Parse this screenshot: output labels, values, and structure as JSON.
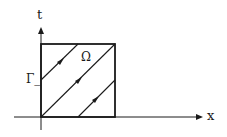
{
  "diagram": {
    "axes": {
      "vertical_label": "t",
      "horizontal_label": "x"
    },
    "region_label": "Ω",
    "boundary_label": "Γ_",
    "characteristics": [
      {
        "from": [
          41,
          80
        ],
        "to": [
          78,
          44
        ],
        "arrow_at": [
          62,
          60
        ]
      },
      {
        "from": [
          41,
          117
        ],
        "to": [
          115,
          44
        ],
        "arrow_at": [
          80,
          79
        ]
      },
      {
        "from": [
          78,
          117
        ],
        "to": [
          115,
          80
        ],
        "arrow_at": [
          97,
          98
        ]
      }
    ],
    "colors": {
      "stroke": "#1a1a1a",
      "background": "#ffffff"
    }
  }
}
